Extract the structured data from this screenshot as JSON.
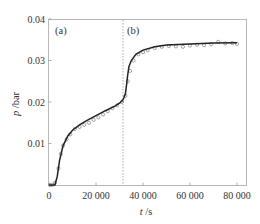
{
  "chart_data": {
    "type": "line",
    "title": "",
    "xlabel": "t /s",
    "ylabel": "p /bar",
    "xlim": [
      0,
      84000
    ],
    "ylim": [
      0,
      0.04
    ],
    "x_ticks": [
      0,
      20000,
      40000,
      60000,
      80000
    ],
    "x_tick_labels": [
      "0",
      "20 000",
      "40 000",
      "60 000",
      "80 000"
    ],
    "y_ticks": [
      0.01,
      0.02,
      0.03,
      0.04
    ],
    "y_tick_labels": [
      "0.01",
      "0.02",
      "0.03",
      "0.04"
    ],
    "grid": false,
    "legend": null,
    "annotations": [
      {
        "text": "(a)",
        "region": "left of divider"
      },
      {
        "text": "(b)",
        "region": "right of divider"
      }
    ],
    "divider": {
      "x": 31500,
      "style": "dotted vertical line"
    },
    "series": [
      {
        "name": "fit",
        "style": "solid line",
        "x": [
          0,
          2500,
          3500,
          4500,
          6000,
          8000,
          10000,
          13000,
          16000,
          20000,
          24000,
          28000,
          30000,
          31500,
          32500,
          33000,
          33500,
          34000,
          35000,
          37000,
          40000,
          45000,
          50000,
          60000,
          70000,
          80000
        ],
        "y": [
          0.0,
          0.0,
          0.002,
          0.006,
          0.0095,
          0.0118,
          0.0132,
          0.0145,
          0.0155,
          0.0167,
          0.0179,
          0.019,
          0.0197,
          0.0205,
          0.022,
          0.024,
          0.0265,
          0.0285,
          0.03,
          0.0315,
          0.0325,
          0.0333,
          0.0337,
          0.034,
          0.0342,
          0.0343
        ]
      },
      {
        "name": "measured",
        "style": "open circles",
        "x": [
          500,
          1500,
          2500,
          4000,
          5000,
          6000,
          7500,
          9000,
          11000,
          13000,
          15000,
          17000,
          19000,
          21000,
          23000,
          25000,
          27000,
          29000,
          31000,
          32500,
          33500,
          34500,
          36000,
          38000,
          40000,
          42000,
          45000,
          48000,
          51000,
          54000,
          57000,
          60000,
          63000,
          66000,
          69000,
          72000,
          75000,
          78000,
          80000
        ],
        "y": [
          0.0,
          0.0,
          0.0005,
          0.004,
          0.0075,
          0.0095,
          0.011,
          0.0122,
          0.0135,
          0.014,
          0.0145,
          0.015,
          0.0157,
          0.0163,
          0.017,
          0.0178,
          0.0185,
          0.0192,
          0.02,
          0.0215,
          0.025,
          0.0275,
          0.03,
          0.0315,
          0.032,
          0.0325,
          0.033,
          0.0333,
          0.0335,
          0.0334,
          0.0333,
          0.0336,
          0.0338,
          0.0337,
          0.0339,
          0.0345,
          0.0341,
          0.0342,
          0.034
        ]
      }
    ]
  },
  "labels": {
    "panel_a": "(a)",
    "panel_b": "(b)",
    "x_axis": "t /s",
    "y_axis": "p /bar"
  }
}
